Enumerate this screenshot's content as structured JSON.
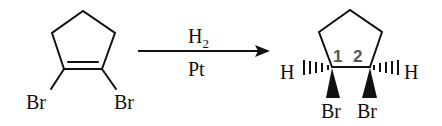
{
  "reaction": {
    "reactant": {
      "name": "1,2-dibromocyclopentene",
      "substituents": [
        "Br",
        "Br"
      ]
    },
    "arrow": {
      "above": "H",
      "above_subscript": "2",
      "below": "Pt"
    },
    "product": {
      "name": "cis-1,2-dibromocyclopentane",
      "carbon_labels": [
        "1",
        "2"
      ],
      "hydrogens": [
        "H",
        "H"
      ],
      "substituents": [
        "Br",
        "Br"
      ]
    }
  },
  "colors": {
    "ink": "#111111",
    "locant": "#555555",
    "background": "#ffffff"
  }
}
